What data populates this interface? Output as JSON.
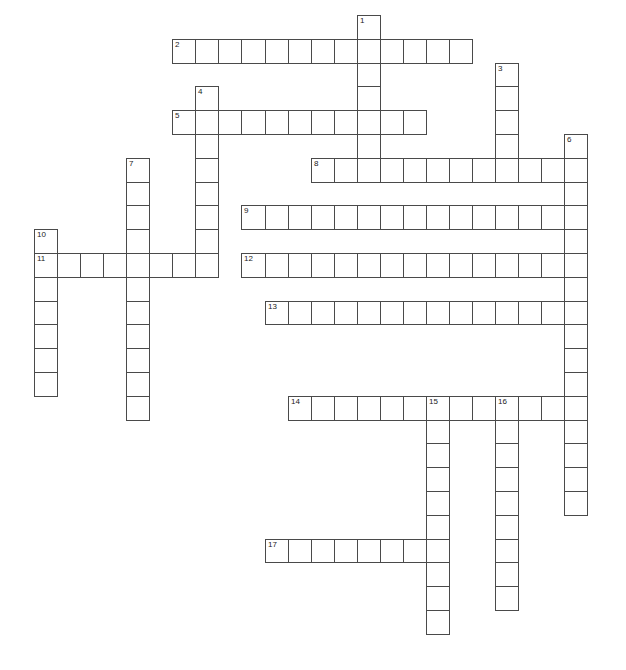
{
  "puzzle": {
    "type": "crossword",
    "grid": {
      "origin_x": 34,
      "origin_y": 15,
      "cell_w": 23.05,
      "cell_h": 23.8
    },
    "border_color": "#4a4a4a",
    "words": [
      {
        "number": "1",
        "direction": "down",
        "row": 0,
        "col": 14,
        "length": 7
      },
      {
        "number": "2",
        "direction": "across",
        "row": 1,
        "col": 6,
        "length": 13
      },
      {
        "number": "3",
        "direction": "down",
        "row": 2,
        "col": 20,
        "length": 5
      },
      {
        "number": "4",
        "direction": "down",
        "row": 3,
        "col": 7,
        "length": 8
      },
      {
        "number": "5",
        "direction": "across",
        "row": 4,
        "col": 6,
        "length": 11
      },
      {
        "number": "6",
        "direction": "down",
        "row": 5,
        "col": 23,
        "length": 16
      },
      {
        "number": "7",
        "direction": "down",
        "row": 6,
        "col": 4,
        "length": 11
      },
      {
        "number": "8",
        "direction": "across",
        "row": 6,
        "col": 12,
        "length": 12
      },
      {
        "number": "9",
        "direction": "across",
        "row": 8,
        "col": 9,
        "length": 15
      },
      {
        "number": "10",
        "direction": "down",
        "row": 9,
        "col": 0,
        "length": 7
      },
      {
        "number": "11",
        "direction": "across",
        "row": 10,
        "col": 0,
        "length": 8
      },
      {
        "number": "12",
        "direction": "across",
        "row": 10,
        "col": 9,
        "length": 15
      },
      {
        "number": "13",
        "direction": "across",
        "row": 12,
        "col": 10,
        "length": 14
      },
      {
        "number": "14",
        "direction": "across",
        "row": 16,
        "col": 11,
        "length": 13
      },
      {
        "number": "15",
        "direction": "down",
        "row": 16,
        "col": 17,
        "length": 10
      },
      {
        "number": "16",
        "direction": "down",
        "row": 16,
        "col": 20,
        "length": 9
      },
      {
        "number": "17",
        "direction": "across",
        "row": 22,
        "col": 10,
        "length": 8
      }
    ]
  }
}
